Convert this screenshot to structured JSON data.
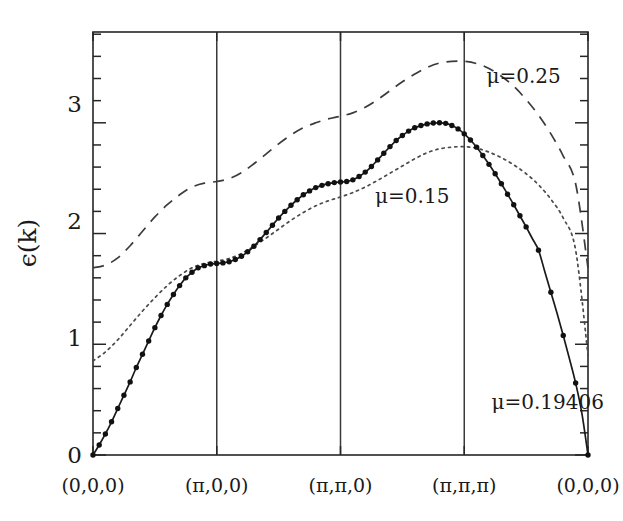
{
  "figure": {
    "kind": "band-structure-dispersion-plot",
    "background_color": "#ffffff",
    "ink_color": "#1a1a1a"
  },
  "axes": {
    "y_title": "ϵ(k)",
    "x_title": "",
    "y_major_ticks": [
      "0",
      "1",
      "2",
      "3"
    ],
    "y_major_values": [
      0,
      1,
      2,
      3
    ],
    "y_minor_per_interval": 4,
    "x_tick_labels": [
      "(0,0,0)",
      "(π,0,0)",
      "(π,π,0)",
      "(π,π,π)",
      "(0,0,0)"
    ],
    "xlim": [
      0,
      4
    ],
    "ylim": [
      0,
      3.82
    ],
    "grid": "vertical-only",
    "frame": "box"
  },
  "annotations": [
    {
      "name": "mu-025-label",
      "text": "μ=0.25",
      "x": 3.18,
      "y": 3.36
    },
    {
      "name": "mu-015-label",
      "text": "μ=0.15",
      "x": 2.28,
      "y": 2.28
    },
    {
      "name": "mu-019406-label",
      "text": "μ=0.19406",
      "x": 3.22,
      "y": 0.42
    }
  ],
  "chart_data": {
    "type": "line",
    "title": "",
    "xlabel": "",
    "ylabel": "ϵ(k)",
    "xlim": [
      0,
      4
    ],
    "ylim": [
      0,
      3.82
    ],
    "grid": "vertical gridlines at high-symmetry points",
    "legend_position": "inline annotations",
    "x_tick_positions": [
      0,
      1,
      2,
      3,
      4
    ],
    "x_tick_labels": [
      "(0,0,0)",
      "(π,0,0)",
      "(π,π,0)",
      "(π,π,π)",
      "(0,0,0)"
    ],
    "y_ticks": [
      0,
      1,
      2,
      3
    ],
    "series": [
      {
        "name": "μ=0.19406",
        "style": "solid-with-markers",
        "marker": "filled-circle",
        "x": [
          0.0,
          0.05,
          0.1,
          0.15,
          0.2,
          0.25,
          0.3,
          0.35,
          0.4,
          0.45,
          0.5,
          0.55,
          0.6,
          0.65,
          0.7,
          0.75,
          0.8,
          0.85,
          0.9,
          0.95,
          1.0,
          1.05,
          1.1,
          1.15,
          1.2,
          1.25,
          1.3,
          1.35,
          1.4,
          1.45,
          1.5,
          1.55,
          1.6,
          1.65,
          1.7,
          1.75,
          1.8,
          1.85,
          1.9,
          1.95,
          2.0,
          2.05,
          2.1,
          2.15,
          2.2,
          2.25,
          2.3,
          2.35,
          2.4,
          2.45,
          2.5,
          2.55,
          2.6,
          2.65,
          2.7,
          2.75,
          2.8,
          2.85,
          2.9,
          2.95,
          3.0,
          3.05,
          3.1,
          3.15,
          3.2,
          3.25,
          3.3,
          3.35,
          3.4,
          3.45,
          3.5,
          3.55,
          3.6,
          3.65,
          3.7,
          3.75,
          3.8,
          3.85,
          3.9,
          3.95,
          4.0
        ],
        "y": [
          0.0,
          0.09,
          0.19,
          0.3,
          0.42,
          0.54,
          0.66,
          0.79,
          0.91,
          1.03,
          1.15,
          1.26,
          1.36,
          1.45,
          1.53,
          1.6,
          1.65,
          1.69,
          1.71,
          1.725,
          1.73,
          1.735,
          1.745,
          1.765,
          1.795,
          1.835,
          1.885,
          1.945,
          2.01,
          2.075,
          2.14,
          2.2,
          2.255,
          2.305,
          2.35,
          2.385,
          2.415,
          2.435,
          2.45,
          2.46,
          2.465,
          2.47,
          2.485,
          2.515,
          2.555,
          2.605,
          2.665,
          2.725,
          2.785,
          2.84,
          2.885,
          2.925,
          2.955,
          2.975,
          2.99,
          2.998,
          3.0,
          2.995,
          2.975,
          2.945,
          2.9,
          2.845,
          2.78,
          2.705,
          2.625,
          2.54,
          2.45,
          2.355,
          2.26,
          2.16,
          2.06,
          1.955,
          1.85,
          1.66,
          1.47,
          1.28,
          1.08,
          0.87,
          0.65,
          0.38,
          0.0
        ],
        "marker_x": [
          0.0,
          0.05,
          0.1,
          0.15,
          0.2,
          0.25,
          0.3,
          0.35,
          0.4,
          0.45,
          0.5,
          0.55,
          0.6,
          0.65,
          0.7,
          0.75,
          0.8,
          0.85,
          0.9,
          0.95,
          1.0,
          1.05,
          1.1,
          1.15,
          1.2,
          1.25,
          1.3,
          1.35,
          1.4,
          1.45,
          1.5,
          1.55,
          1.6,
          1.65,
          1.7,
          1.75,
          1.8,
          1.85,
          1.9,
          1.95,
          2.0,
          2.05,
          2.1,
          2.15,
          2.2,
          2.25,
          2.3,
          2.35,
          2.4,
          2.45,
          2.5,
          2.55,
          2.6,
          2.65,
          2.7,
          2.75,
          2.8,
          2.85,
          2.9,
          2.95,
          3.0,
          3.05,
          3.1,
          3.15,
          3.2,
          3.25,
          3.3,
          3.35,
          3.4,
          3.45,
          3.5,
          3.6,
          3.7,
          3.8,
          3.9,
          4.0
        ]
      },
      {
        "name": "μ=0.15",
        "style": "dotted",
        "marker": "none",
        "x": [
          0.0,
          0.1,
          0.2,
          0.3,
          0.4,
          0.5,
          0.6,
          0.7,
          0.8,
          0.9,
          1.0,
          1.1,
          1.2,
          1.3,
          1.4,
          1.5,
          1.6,
          1.7,
          1.8,
          1.9,
          2.0,
          2.1,
          2.2,
          2.3,
          2.4,
          2.5,
          2.6,
          2.7,
          2.8,
          2.9,
          3.0,
          3.1,
          3.2,
          3.3,
          3.4,
          3.5,
          3.6,
          3.7,
          3.8,
          3.9,
          4.0
        ],
        "y": [
          0.85,
          0.93,
          1.04,
          1.17,
          1.3,
          1.42,
          1.53,
          1.62,
          1.69,
          1.73,
          1.75,
          1.775,
          1.82,
          1.885,
          1.96,
          2.04,
          2.12,
          2.19,
          2.25,
          2.295,
          2.33,
          2.37,
          2.42,
          2.48,
          2.545,
          2.61,
          2.675,
          2.73,
          2.765,
          2.78,
          2.785,
          2.77,
          2.735,
          2.685,
          2.62,
          2.54,
          2.44,
          2.31,
          2.14,
          1.85,
          0.9
        ]
      },
      {
        "name": "μ=0.25",
        "style": "dashed",
        "marker": "none",
        "x": [
          0.0,
          0.1,
          0.2,
          0.3,
          0.4,
          0.5,
          0.6,
          0.7,
          0.8,
          0.9,
          1.0,
          1.1,
          1.2,
          1.3,
          1.4,
          1.5,
          1.6,
          1.7,
          1.8,
          1.9,
          2.0,
          2.1,
          2.2,
          2.3,
          2.4,
          2.5,
          2.6,
          2.7,
          2.8,
          2.9,
          3.0,
          3.1,
          3.2,
          3.3,
          3.4,
          3.5,
          3.6,
          3.7,
          3.8,
          3.9,
          4.0
        ],
        "y": [
          1.69,
          1.715,
          1.78,
          1.89,
          2.02,
          2.15,
          2.26,
          2.35,
          2.42,
          2.455,
          2.47,
          2.495,
          2.55,
          2.63,
          2.72,
          2.81,
          2.89,
          2.955,
          3.0,
          3.035,
          3.06,
          3.09,
          3.14,
          3.21,
          3.29,
          3.37,
          3.44,
          3.5,
          3.54,
          3.555,
          3.555,
          3.535,
          3.49,
          3.42,
          3.33,
          3.21,
          3.07,
          2.9,
          2.7,
          2.45,
          1.69
        ]
      }
    ]
  }
}
